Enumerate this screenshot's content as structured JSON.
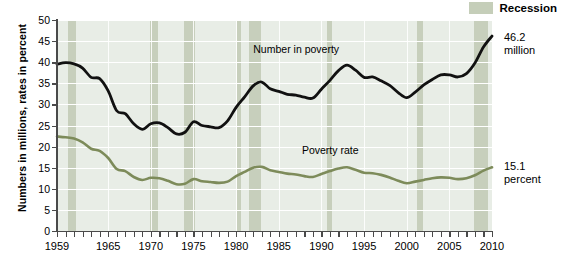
{
  "legend": {
    "label": "Recession",
    "swatch_color": "#c5ceb9"
  },
  "axes": {
    "ylabel": "Numbers in millions, rates in percent",
    "yticks": [
      "0",
      "5",
      "10",
      "15",
      "20",
      "25",
      "30",
      "35",
      "40",
      "45",
      "50"
    ],
    "xticks": [
      "1959",
      "1965",
      "1970",
      "1975",
      "1980",
      "1985",
      "1990",
      "1995",
      "2000",
      "2005",
      "2010"
    ]
  },
  "annotations": {
    "number_in_poverty": "Number in poverty",
    "poverty_rate": "Poverty rate",
    "end_number_value": "46.2",
    "end_number_unit": "million",
    "end_rate_value": "15.1",
    "end_rate_unit": "percent"
  },
  "colors": {
    "number_line": "#111111",
    "rate_line": "#7d8b5a",
    "recession_band": "#c5ceb9",
    "plot_background": "#e8ede6",
    "gridline": "#ffffff"
  },
  "chart_data": {
    "type": "line",
    "title": "",
    "xlabel": "",
    "ylabel": "Numbers in millions, rates in percent",
    "xlim": [
      1959,
      2010
    ],
    "ylim": [
      0,
      50
    ],
    "grid": true,
    "legend_position": "top-right",
    "x": [
      1959,
      1960,
      1961,
      1962,
      1963,
      1964,
      1965,
      1966,
      1967,
      1968,
      1969,
      1970,
      1971,
      1972,
      1973,
      1974,
      1975,
      1976,
      1977,
      1978,
      1979,
      1980,
      1981,
      1982,
      1983,
      1984,
      1985,
      1986,
      1987,
      1988,
      1989,
      1990,
      1991,
      1992,
      1993,
      1994,
      1995,
      1996,
      1997,
      1998,
      1999,
      2000,
      2001,
      2002,
      2003,
      2004,
      2005,
      2006,
      2007,
      2008,
      2009,
      2010
    ],
    "series": [
      {
        "name": "Number in poverty",
        "unit": "millions",
        "color": "#111111",
        "values": [
          39.5,
          39.9,
          39.6,
          38.6,
          36.4,
          36.1,
          33.2,
          28.5,
          27.8,
          25.4,
          24.1,
          25.4,
          25.6,
          24.5,
          23.0,
          23.4,
          25.9,
          25.0,
          24.7,
          24.5,
          26.1,
          29.3,
          31.8,
          34.4,
          35.3,
          33.7,
          33.1,
          32.4,
          32.2,
          31.7,
          31.5,
          33.6,
          35.7,
          38.0,
          39.3,
          38.1,
          36.4,
          36.5,
          35.6,
          34.5,
          32.8,
          31.6,
          32.9,
          34.6,
          35.9,
          37.0,
          37.0,
          36.5,
          37.3,
          39.8,
          43.6,
          46.2
        ]
      },
      {
        "name": "Poverty rate",
        "unit": "percent",
        "color": "#7d8b5a",
        "values": [
          22.4,
          22.2,
          21.9,
          21.0,
          19.5,
          19.0,
          17.3,
          14.7,
          14.2,
          12.8,
          12.1,
          12.6,
          12.5,
          11.9,
          11.1,
          11.2,
          12.3,
          11.8,
          11.6,
          11.4,
          11.7,
          13.0,
          14.0,
          15.0,
          15.2,
          14.4,
          14.0,
          13.6,
          13.4,
          13.0,
          12.8,
          13.5,
          14.2,
          14.8,
          15.1,
          14.5,
          13.8,
          13.7,
          13.3,
          12.7,
          11.9,
          11.3,
          11.7,
          12.1,
          12.5,
          12.7,
          12.6,
          12.3,
          12.5,
          13.2,
          14.3,
          15.1
        ]
      }
    ],
    "recessions": [
      {
        "start": 1960.3,
        "end": 1961.2
      },
      {
        "start": 1969.9,
        "end": 1970.9
      },
      {
        "start": 1973.9,
        "end": 1975.2
      },
      {
        "start": 1980.1,
        "end": 1980.6
      },
      {
        "start": 1981.5,
        "end": 1982.9
      },
      {
        "start": 1990.6,
        "end": 1991.2
      },
      {
        "start": 2001.2,
        "end": 2001.9
      },
      {
        "start": 2007.9,
        "end": 2009.5
      }
    ]
  }
}
